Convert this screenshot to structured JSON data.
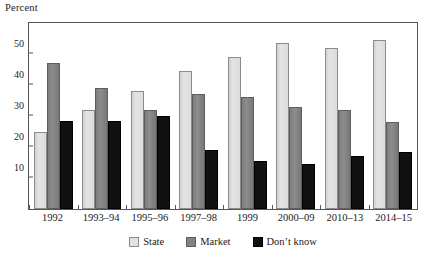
{
  "chart_data": {
    "type": "bar",
    "title": "",
    "subtitle": "",
    "ylabel": "Percent",
    "xlabel": "",
    "ylim": [
      0,
      60
    ],
    "yticks": [
      10,
      20,
      30,
      40,
      50
    ],
    "grid": false,
    "legend_position": "bottom-center",
    "categories": [
      "1992",
      "1993–94",
      "1995–96",
      "1997–98",
      "1999",
      "2000–09",
      "2010–13",
      "2014–15"
    ],
    "series": [
      {
        "name": "State",
        "color": "#dcdcdc",
        "values": [
          25,
          32,
          38,
          44.5,
          49,
          53.5,
          52,
          54.5
        ]
      },
      {
        "name": "Market",
        "color": "#838383",
        "values": [
          47,
          39,
          32,
          37,
          36,
          33,
          32,
          28
        ]
      },
      {
        "name": "Don't know",
        "color": "#111111",
        "values": [
          28.5,
          28.5,
          30,
          19,
          15.5,
          14.5,
          17,
          18.5
        ]
      }
    ]
  },
  "axis": {
    "y_title": "Percent"
  },
  "legend": {
    "items": [
      {
        "label": "State"
      },
      {
        "label": "Market"
      },
      {
        "label": "Don’t know"
      }
    ]
  }
}
